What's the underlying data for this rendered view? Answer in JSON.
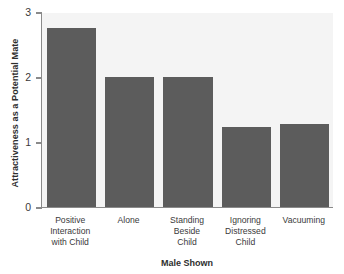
{
  "chart_data": {
    "type": "bar",
    "title": "",
    "categories": [
      "Positive Interaction with Child",
      "Alone",
      "Standing Beside Child",
      "Ignoring Distressed Child",
      "Vacuuming"
    ],
    "category_lines": [
      [
        "Positive",
        "Interaction",
        "with Child"
      ],
      [
        "Alone"
      ],
      [
        "Standing",
        "Beside",
        "Child"
      ],
      [
        "Ignoring",
        "Distressed",
        "Child"
      ],
      [
        "Vacuuming"
      ]
    ],
    "values": [
      2.75,
      2.0,
      2.0,
      1.23,
      1.28
    ],
    "xlabel": "Male Shown",
    "ylabel": "Attractiveness as a Potential Mate",
    "ylim": [
      0,
      3
    ],
    "yticks": [
      0,
      1,
      2,
      3
    ],
    "ytick_labels": [
      "0",
      "1",
      "2",
      "3"
    ],
    "grid": false,
    "legend": null,
    "colors": {
      "bar": "#5c5c5c",
      "plot_background": "#f4f4f4",
      "axis": "#8a8a8a",
      "text": "#3a3a3a",
      "page_background": "#ffffff"
    }
  }
}
